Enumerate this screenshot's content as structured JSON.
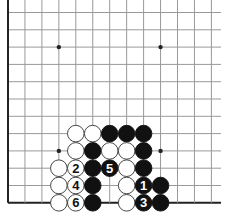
{
  "board": {
    "columns": 13,
    "rows": 12,
    "origin_x": 8,
    "origin_y": 12.5,
    "spacing_x": 16.95,
    "spacing_y": 17.3,
    "line_extend_right": 221,
    "left_edge": true,
    "bottom_edge": true,
    "star_points": [
      [
        3,
        2
      ],
      [
        9,
        2
      ],
      [
        3,
        8
      ],
      [
        9,
        8
      ]
    ],
    "colors": {
      "line": "#999999",
      "edge": "#222222",
      "black_stone": "#111111",
      "white_stone": "#ffffff",
      "stone_outline": "#333333"
    }
  },
  "stones": [
    {
      "col": 4,
      "row": 7,
      "color": "white",
      "label": ""
    },
    {
      "col": 5,
      "row": 7,
      "color": "white",
      "label": ""
    },
    {
      "col": 6,
      "row": 7,
      "color": "black",
      "label": ""
    },
    {
      "col": 7,
      "row": 7,
      "color": "black",
      "label": ""
    },
    {
      "col": 8,
      "row": 7,
      "color": "black",
      "label": ""
    },
    {
      "col": 4,
      "row": 8,
      "color": "white",
      "label": ""
    },
    {
      "col": 5,
      "row": 8,
      "color": "black",
      "label": ""
    },
    {
      "col": 6,
      "row": 8,
      "color": "white",
      "label": ""
    },
    {
      "col": 7,
      "row": 8,
      "color": "white",
      "label": ""
    },
    {
      "col": 8,
      "row": 8,
      "color": "black",
      "label": ""
    },
    {
      "col": 3,
      "row": 9,
      "color": "white",
      "label": ""
    },
    {
      "col": 4,
      "row": 9,
      "color": "white",
      "label": "2"
    },
    {
      "col": 5,
      "row": 9,
      "color": "black",
      "label": ""
    },
    {
      "col": 6,
      "row": 9,
      "color": "black",
      "label": "5"
    },
    {
      "col": 7,
      "row": 9,
      "color": "white",
      "label": ""
    },
    {
      "col": 8,
      "row": 9,
      "color": "black",
      "label": ""
    },
    {
      "col": 3,
      "row": 10,
      "color": "white",
      "label": ""
    },
    {
      "col": 4,
      "row": 10,
      "color": "white",
      "label": "4"
    },
    {
      "col": 5,
      "row": 10,
      "color": "black",
      "label": ""
    },
    {
      "col": 7,
      "row": 10,
      "color": "white",
      "label": ""
    },
    {
      "col": 8,
      "row": 10,
      "color": "black",
      "label": "1"
    },
    {
      "col": 9,
      "row": 10,
      "color": "black",
      "label": ""
    },
    {
      "col": 3,
      "row": 11,
      "color": "white",
      "label": ""
    },
    {
      "col": 4,
      "row": 11,
      "color": "white",
      "label": "6"
    },
    {
      "col": 5,
      "row": 11,
      "color": "black",
      "label": ""
    },
    {
      "col": 7,
      "row": 11,
      "color": "white",
      "label": ""
    },
    {
      "col": 8,
      "row": 11,
      "color": "black",
      "label": "3"
    },
    {
      "col": 9,
      "row": 11,
      "color": "black",
      "label": ""
    }
  ]
}
